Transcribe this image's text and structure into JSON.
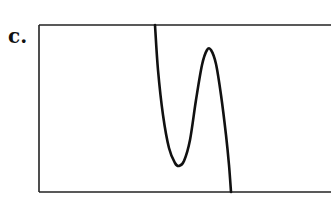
{
  "figure": {
    "label": "c.",
    "colors": {
      "line": "#111111",
      "background": "#ffffff"
    }
  },
  "chart_data": {
    "type": "line",
    "title": "",
    "xlabel": "",
    "ylabel": "",
    "grid": false,
    "legend": null,
    "frame_px": {
      "left": 39,
      "top": 25,
      "right": 331,
      "bottom": 192
    },
    "curve_points_px": [
      [
        155,
        25
      ],
      [
        158,
        70
      ],
      [
        163,
        115
      ],
      [
        169,
        148
      ],
      [
        175,
        163
      ],
      [
        179,
        166
      ],
      [
        184,
        161
      ],
      [
        190,
        140
      ],
      [
        196,
        100
      ],
      [
        202,
        65
      ],
      [
        207,
        50
      ],
      [
        211,
        50
      ],
      [
        216,
        64
      ],
      [
        221,
        95
      ],
      [
        226,
        135
      ],
      [
        229,
        165
      ],
      [
        231,
        192
      ]
    ],
    "key_features": {
      "local_minimum_px": [
        179,
        166
      ],
      "local_maximum_px": [
        209,
        49
      ],
      "exits": "top-left at x≈155, bottom at x≈231"
    }
  }
}
